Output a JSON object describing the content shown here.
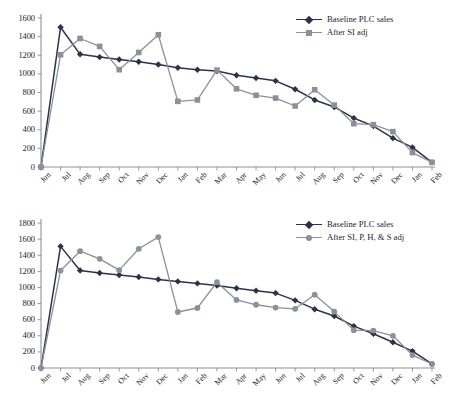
{
  "figure": {
    "background": "#ffffff",
    "series_colors": {
      "baseline": "#2b3349",
      "adjusted": "#8b9099"
    }
  },
  "charts": [
    {
      "id": "chart-top",
      "legend": {
        "position": "top-right",
        "entries": [
          {
            "label": "Baseline PLC sales",
            "color": "#2b3349",
            "marker": "diamond"
          },
          {
            "label": "After SI adj",
            "color": "#8b9099",
            "marker": "square"
          }
        ]
      },
      "chart_data": {
        "type": "line",
        "title": "",
        "xlabel": "",
        "ylabel": "",
        "grid": false,
        "legend_position": "top-right",
        "ylim": [
          0,
          1600
        ],
        "yticks": [
          0,
          200,
          400,
          600,
          800,
          1000,
          1200,
          1400,
          1600
        ],
        "categories": [
          "Jun",
          "Jul",
          "Aug",
          "Sep",
          "Oct",
          "Nov",
          "Dec",
          "Jan",
          "Feb",
          "Mar",
          "Apr",
          "May",
          "Jun",
          "Jul",
          "Aug",
          "Sep",
          "Oct",
          "Nov",
          "Dec",
          "Jan",
          "Feb"
        ],
        "series": [
          {
            "name": "Baseline PLC sales",
            "color": "#2b3349",
            "marker": "diamond",
            "values": [
              0,
              1500,
              1210,
              1180,
              1155,
              1130,
              1100,
              1065,
              1045,
              1030,
              985,
              955,
              925,
              835,
              720,
              645,
              525,
              440,
              310,
              210,
              50
            ]
          },
          {
            "name": "After SI adj",
            "color": "#8b9099",
            "marker": "square",
            "values": [
              0,
              1205,
              1380,
              1295,
              1045,
              1230,
              1420,
              705,
              720,
              1040,
              840,
              770,
              740,
              655,
              830,
              665,
              465,
              455,
              380,
              155,
              50
            ]
          }
        ]
      }
    },
    {
      "id": "chart-bottom",
      "legend": {
        "position": "top-right",
        "entries": [
          {
            "label": "Baseline PLC sales",
            "color": "#2b3349",
            "marker": "diamond"
          },
          {
            "label": "After SI, P, H, & S adj",
            "color": "#8b9099",
            "marker": "circle"
          }
        ]
      },
      "chart_data": {
        "type": "line",
        "title": "",
        "xlabel": "",
        "ylabel": "",
        "grid": false,
        "legend_position": "top-right",
        "ylim": [
          0,
          1800
        ],
        "yticks": [
          0,
          200,
          400,
          600,
          800,
          1000,
          1200,
          1400,
          1600,
          1800
        ],
        "categories": [
          "Jun",
          "Jul",
          "Aug",
          "Sep",
          "Oct",
          "Nov",
          "Dec",
          "Jan",
          "Feb",
          "Mar",
          "Apr",
          "May",
          "Jun",
          "Jul",
          "Aug",
          "Sep",
          "Oct",
          "Nov",
          "Dec",
          "Jan",
          "Feb"
        ],
        "series": [
          {
            "name": "Baseline PLC sales",
            "color": "#2b3349",
            "marker": "diamond",
            "values": [
              0,
              1510,
              1210,
              1180,
              1155,
              1130,
              1100,
              1075,
              1050,
              1025,
              990,
              960,
              930,
              840,
              730,
              645,
              520,
              425,
              320,
              210,
              50
            ]
          },
          {
            "name": "After SI, P, H, & S adj",
            "color": "#8b9099",
            "marker": "circle",
            "values": [
              0,
              1210,
              1450,
              1355,
              1215,
              1480,
              1625,
              695,
              745,
              1065,
              845,
              785,
              750,
              735,
              910,
              700,
              470,
              465,
              400,
              160,
              50
            ]
          }
        ]
      }
    }
  ]
}
